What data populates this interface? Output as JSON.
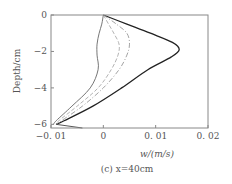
{
  "chart_data": {
    "type": "line",
    "title": "",
    "caption": "(c) x=40cm",
    "xlabel": "w/(m/s)",
    "ylabel": "Depth/cm",
    "xlim": [
      -0.01,
      0.02
    ],
    "ylim": [
      -6.2,
      0
    ],
    "xticks": [
      "-0.01",
      "0",
      "0.01",
      "0.02"
    ],
    "yticks": [
      "0",
      "-2",
      "-4",
      "-6"
    ],
    "grid": false,
    "series": [
      {
        "name": "solid-thick",
        "style": "solid",
        "color": "#222222",
        "depth": [
          0,
          -0.5,
          -1.0,
          -1.5,
          -1.9,
          -2.3,
          -3.0,
          -4.0,
          -5.0,
          -5.8,
          -6.0
        ],
        "w": [
          0.0,
          0.0045,
          0.009,
          0.0132,
          0.0145,
          0.013,
          0.0085,
          0.0035,
          -0.002,
          -0.0075,
          -0.009
        ]
      },
      {
        "name": "dash-dot",
        "style": "dashdot",
        "color": "#999999",
        "depth": [
          0,
          -0.5,
          -1.0,
          -1.6,
          -2.2,
          -3.0,
          -4.0,
          -5.0,
          -5.8,
          -6.0
        ],
        "w": [
          0.0,
          0.0025,
          0.0045,
          0.005,
          0.0045,
          0.003,
          0.0,
          -0.004,
          -0.008,
          -0.009
        ]
      },
      {
        "name": "dashed",
        "style": "dashed",
        "color": "#aaaaaa",
        "depth": [
          0,
          -0.5,
          -1.0,
          -1.6,
          -2.2,
          -3.0,
          -4.0,
          -5.0,
          -5.8,
          -6.0
        ],
        "w": [
          0.0,
          0.001,
          0.002,
          0.003,
          0.0028,
          0.0015,
          -0.001,
          -0.005,
          -0.0085,
          -0.009
        ]
      },
      {
        "name": "solid-thin",
        "style": "solid",
        "color": "#666666",
        "depth": [
          0,
          -0.5,
          -1.0,
          -1.6,
          -2.2,
          -3.0,
          -4.0,
          -5.0,
          -5.8,
          -6.0
        ],
        "w": [
          0.0,
          -0.0003,
          -0.0008,
          -0.0012,
          -0.0012,
          -0.001,
          -0.0025,
          -0.006,
          -0.009,
          -0.0095
        ]
      }
    ]
  }
}
